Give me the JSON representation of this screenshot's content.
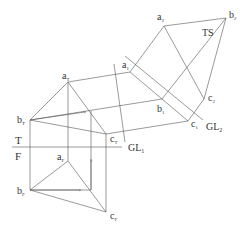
{
  "diagram": {
    "colors": {
      "line": "#555555",
      "text": "#333333",
      "background": "#ffffff"
    },
    "labels": {
      "top_view_plane": "T",
      "front_view_plane": "F",
      "ground_line_1": "GL",
      "ground_line_1_sub": "1",
      "ground_line_2": "GL",
      "ground_line_2_sub": "2",
      "true_shape": "TS",
      "a_top": "a",
      "a_top_sub": "T",
      "b_top": "b",
      "b_top_sub": "T",
      "c_top": "c",
      "c_top_sub": "T",
      "a_front": "a",
      "a_front_sub": "F",
      "b_front": "b",
      "b_front_sub": "F",
      "c_front": "c",
      "c_front_sub": "F",
      "a_aux1": "a",
      "a_aux1_sub": "1",
      "b_aux1": "b",
      "b_aux1_sub": "1",
      "c_aux1": "c",
      "c_aux1_sub": "1",
      "a_aux2": "a",
      "a_aux2_sub": "2",
      "b_aux2": "b",
      "b_aux2_sub": "2",
      "c_aux2": "c",
      "c_aux2_sub": "2"
    },
    "points": {
      "aT": [
        68,
        82
      ],
      "bT": [
        30,
        120
      ],
      "cT": [
        106,
        134
      ],
      "aF": [
        68,
        161
      ],
      "bF": [
        30,
        190
      ],
      "cF": [
        106,
        212
      ],
      "xT": [
        91,
        111
      ],
      "xF": [
        91,
        190
      ],
      "a1": [
        130,
        72
      ],
      "b1": [
        162,
        99
      ],
      "c1": [
        188,
        121
      ],
      "a2": [
        164,
        26
      ],
      "b2": [
        226,
        18
      ],
      "c2": [
        204,
        99
      ]
    }
  }
}
